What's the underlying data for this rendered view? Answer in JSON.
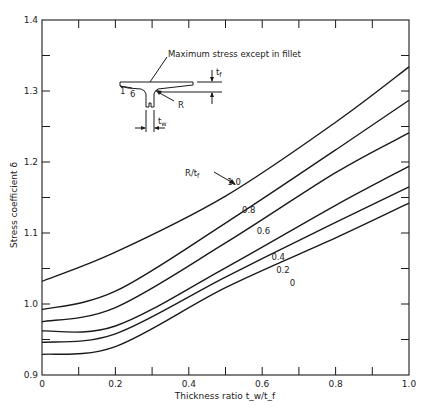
{
  "chart_data": {
    "type": "line",
    "title": "",
    "xlabel": "Thickness ratio t_w/t_f",
    "ylabel": "Stress coefficient δ",
    "xlim": [
      0,
      1.0
    ],
    "ylim": [
      0.9,
      1.4
    ],
    "grid": false,
    "x_ticks": [
      0,
      0.2,
      0.4,
      0.6,
      0.8,
      1.0
    ],
    "x_tick_labels": [
      "0",
      "0.2",
      "0.4",
      "0.6",
      "0.8",
      "1.0"
    ],
    "x_minor_ticks": [
      0.1,
      0.3,
      0.5,
      0.7,
      0.9
    ],
    "y_ticks": [
      0.9,
      1.0,
      1.1,
      1.2,
      1.3,
      1.4
    ],
    "y_tick_labels": [
      "0.9",
      "1.0",
      "1.1",
      "1.2",
      "1.3",
      "1.4"
    ],
    "y_minor_ticks": [
      0.95,
      1.05,
      1.15,
      1.25,
      1.35
    ],
    "legend_title": "R/t_f",
    "x": [
      0,
      0.2,
      0.5,
      0.8,
      1.0
    ],
    "series": [
      {
        "name": "1.0",
        "values": [
          1.032,
          1.073,
          1.152,
          1.256,
          1.334
        ]
      },
      {
        "name": "0.8",
        "values": [
          0.992,
          1.018,
          1.114,
          1.217,
          1.287
        ]
      },
      {
        "name": "0.6",
        "values": [
          0.975,
          0.995,
          1.086,
          1.185,
          1.241
        ]
      },
      {
        "name": "0.4",
        "values": [
          0.962,
          0.969,
          1.051,
          1.139,
          1.194
        ]
      },
      {
        "name": "0.2",
        "values": [
          0.946,
          0.958,
          1.038,
          1.115,
          1.165
        ]
      },
      {
        "name": "0",
        "values": [
          0.929,
          0.94,
          1.023,
          1.093,
          1.142
        ]
      }
    ],
    "series_label_positions": [
      {
        "name": "1.0",
        "x": 0.505,
        "y": 1.168
      },
      {
        "name": "0.8",
        "x": 0.545,
        "y": 1.128
      },
      {
        "name": "0.6",
        "x": 0.585,
        "y": 1.098
      },
      {
        "name": "0.4",
        "x": 0.625,
        "y": 1.062
      },
      {
        "name": "0.2",
        "x": 0.638,
        "y": 1.044
      },
      {
        "name": "0",
        "x": 0.675,
        "y": 1.025
      }
    ],
    "annotations": {
      "max_stress": "Maximum stress except in fillet",
      "radius": "R",
      "flange_thickness": "t_f",
      "web_thickness": "t_w",
      "slope_rise": "1",
      "slope_run": "6",
      "legend_title": "R/t_f"
    }
  }
}
